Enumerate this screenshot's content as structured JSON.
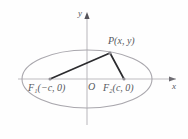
{
  "figure": {
    "colors": {
      "background": "#fefefe",
      "ellipse_stroke": "#a9a7ad",
      "axis_stroke": "#bdbcc0",
      "segment_stroke": "#2b2b2e",
      "label_text": "#55585c",
      "point_marker": "#8d8b91"
    },
    "axes": {
      "x_label": "x",
      "y_label": "y",
      "origin_label": "O",
      "x_arrow": "arrow-right",
      "y_arrow": "arrow-up"
    },
    "points": [
      {
        "id": "P",
        "label": "P(x, y)",
        "x": 110,
        "y": 53
      },
      {
        "id": "F1",
        "label": "F₁(−c, 0)",
        "x": 50,
        "y": 79
      },
      {
        "id": "F2",
        "label": "F₂(c, 0)",
        "x": 124,
        "y": 79
      }
    ],
    "labels": {
      "p_main": "P",
      "p_args": "(x, y)",
      "f_letter": "F",
      "f1_sub": "1",
      "f1_args": "(−c, 0)",
      "f2_sub": "2",
      "f2_args": "(c, 0)"
    },
    "ellipse": {
      "center_x": 87,
      "center_y": 79,
      "radius_x": 65,
      "radius_y": 29
    },
    "segments": [
      {
        "name": "F1-to-P",
        "from": "F1",
        "to": "P"
      },
      {
        "name": "F2-to-P",
        "from": "F2",
        "to": "P"
      }
    ]
  }
}
